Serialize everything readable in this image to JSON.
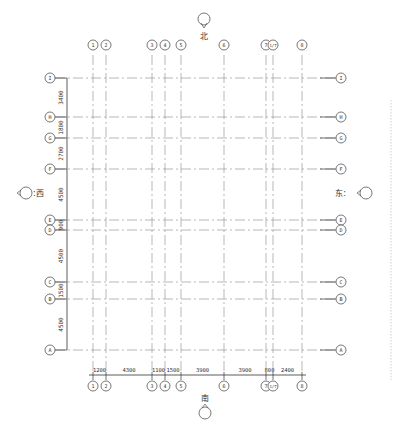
{
  "drawing": {
    "title": "Structural axis grid plan",
    "colors": {
      "grid_line": "#9a9a9a",
      "dimension_line": "#333333",
      "bubble_stroke": "#555555",
      "text": "#333333",
      "border": "#bbbbbb"
    },
    "compass": {
      "north": {
        "label": "北",
        "icon": "north-arrow-icon"
      },
      "south": {
        "label": "南",
        "icon": "south-arrow-icon"
      },
      "west": {
        "label": ":西",
        "icon": "west-arrow-icon"
      },
      "east": {
        "label": "东:",
        "icon": "east-arrow-icon"
      }
    },
    "vertical_axes": [
      {
        "label": "1",
        "x": 93
      },
      {
        "label": "2",
        "x": 106
      },
      {
        "label": "3",
        "x": 152
      },
      {
        "label": "4",
        "x": 165
      },
      {
        "label": "5",
        "x": 181
      },
      {
        "label": "6",
        "x": 224
      },
      {
        "label": "7",
        "x": 266
      },
      {
        "label": "1/7",
        "x": 273
      },
      {
        "label": "8",
        "x": 302
      }
    ],
    "horizontal_axes": [
      {
        "label": "I",
        "y": 78
      },
      {
        "label": "H",
        "y": 117
      },
      {
        "label": "G",
        "y": 138
      },
      {
        "label": "F",
        "y": 169
      },
      {
        "label": "E",
        "y": 220
      },
      {
        "label": "D",
        "y": 230
      },
      {
        "label": "C",
        "y": 282
      },
      {
        "label": "B",
        "y": 299
      },
      {
        "label": "A",
        "y": 350
      }
    ],
    "horizontal_dimensions": [
      "1200",
      "4300",
      "1100",
      "1500",
      "3900",
      "3900",
      "800",
      "2400"
    ],
    "vertical_dimensions": [
      "3400",
      "1800",
      "2700",
      "4500",
      "900",
      "4500",
      "1500",
      "4500"
    ]
  }
}
